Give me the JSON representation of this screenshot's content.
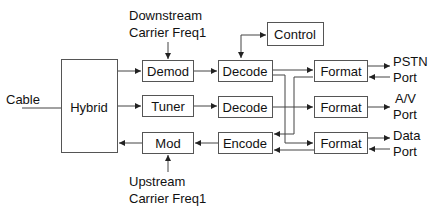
{
  "diagram": {
    "type": "block-diagram",
    "blocks": {
      "hybrid": "Hybrid",
      "demod": "Demod",
      "tuner": "Tuner",
      "mod": "Mod",
      "control": "Control",
      "decode1": "Decode",
      "decode2": "Decode",
      "encode": "Encode",
      "format1": "Format",
      "format2": "Format",
      "format3": "Format"
    },
    "labels": {
      "cable": "Cable",
      "downstream_line1": "Downstream",
      "downstream_line2": "Carrier Freq1",
      "upstream_line1": "Upstream",
      "upstream_line2": "Carrier Freq1",
      "pstn_line1": "PSTN",
      "pstn_line2": "Port",
      "av_line1": "A/V",
      "av_line2": "Port",
      "data_line1": "Data",
      "data_line2": "Port"
    },
    "connections": [
      {
        "from": "Cable",
        "to": "Hybrid"
      },
      {
        "from": "Hybrid",
        "to": "Demod"
      },
      {
        "from": "Hybrid",
        "to": "Tuner"
      },
      {
        "from": "Mod",
        "to": "Hybrid"
      },
      {
        "from": "Downstream Carrier Freq1",
        "to": "Demod"
      },
      {
        "from": "Upstream Carrier Freq1",
        "to": "Mod"
      },
      {
        "from": "Demod",
        "to": "Decode (1)"
      },
      {
        "from": "Tuner",
        "to": "Decode (2)"
      },
      {
        "from": "Encode",
        "to": "Mod"
      },
      {
        "from": "Decode (1)",
        "to": "Control",
        "bidirectional": true
      },
      {
        "from": "Decode (1)",
        "to": "Format (1)"
      },
      {
        "from": "Decode (1)",
        "to": "Format (3)"
      },
      {
        "from": "Decode (2)",
        "to": "Format (2)"
      },
      {
        "from": "Format (1)",
        "to": "Encode"
      },
      {
        "from": "Format (3)",
        "to": "Encode"
      },
      {
        "from": "Format (1)",
        "to": "PSTN Port"
      },
      {
        "from": "PSTN Port",
        "to": "Format (1)"
      },
      {
        "from": "Format (2)",
        "to": "A/V Port"
      },
      {
        "from": "Format (3)",
        "to": "Data Port"
      },
      {
        "from": "Data Port",
        "to": "Format (3)"
      }
    ]
  }
}
